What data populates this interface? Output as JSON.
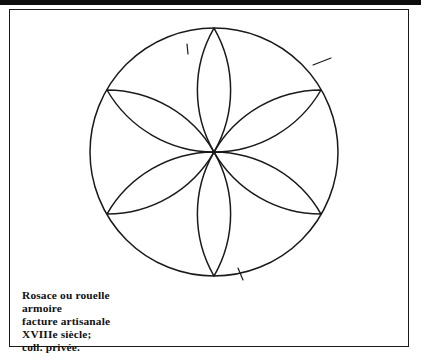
{
  "plate": {
    "title": "Rosace ou rouelle",
    "caption_lines": [
      "Rosace ou rouelle",
      "armoire",
      "facture artisanale",
      "XVIIIe siècle;",
      "coll. privée."
    ],
    "caption_line_1": "Rosace ou rouelle",
    "caption_line_2": "armoire",
    "caption_line_3": "facture artisanale",
    "caption_line_4": "XVIIIe siècle;",
    "caption_line_5": "coll. privée.",
    "frame_color": "#1a1a1a",
    "ink_color": "#1a1a1a",
    "paper_color": "#ffffff"
  },
  "figure": {
    "name": "six-petal-rosette",
    "circle": {
      "center_x": 213,
      "center_y": 151,
      "radius": 124
    },
    "petal_count": 6,
    "petal_tips": [
      {
        "label": "top",
        "x": 213,
        "y": 27
      },
      {
        "label": "upper-right",
        "x": 320,
        "y": 89
      },
      {
        "label": "lower-right",
        "x": 320,
        "y": 213
      },
      {
        "label": "bottom",
        "x": 213,
        "y": 275
      },
      {
        "label": "lower-left",
        "x": 106,
        "y": 213
      },
      {
        "label": "upper-left",
        "x": 106,
        "y": 89
      }
    ],
    "construction_marks": [
      {
        "label": "tick-top-inner",
        "x": 186,
        "y": 42
      },
      {
        "label": "tick-upper-right-outer",
        "x": 316,
        "y": 62
      },
      {
        "label": "tick-bottom",
        "x": 239,
        "y": 272
      }
    ]
  }
}
